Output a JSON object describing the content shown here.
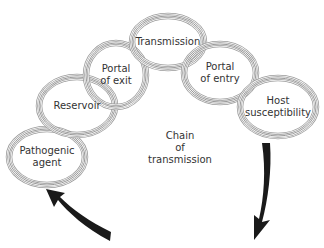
{
  "diagram": {
    "title": "Chain of transmission",
    "center_label": [
      "Chain",
      "of",
      "transmission"
    ],
    "links": [
      {
        "id": "pathogenic-agent",
        "lines": [
          "Pathogenic",
          "agent"
        ],
        "cx": 47,
        "cy": 157,
        "rx": 38,
        "ry": 28
      },
      {
        "id": "reservoir",
        "lines": [
          "Reservoir"
        ],
        "cx": 77,
        "cy": 106,
        "rx": 38,
        "ry": 29
      },
      {
        "id": "portal-of-exit",
        "lines": [
          "Portal",
          "of exit"
        ],
        "cx": 116,
        "cy": 75,
        "rx": 30,
        "ry": 32
      },
      {
        "id": "transmission",
        "lines": [
          "Transmission"
        ],
        "cx": 168,
        "cy": 42,
        "rx": 36,
        "ry": 26
      },
      {
        "id": "portal-of-entry",
        "lines": [
          "Portal",
          "of entry"
        ],
        "cx": 220,
        "cy": 73,
        "rx": 36,
        "ry": 29
      },
      {
        "id": "host-susceptibility",
        "lines": [
          "Host",
          "susceptibility"
        ],
        "cx": 278,
        "cy": 107,
        "rx": 38,
        "ry": 29
      }
    ],
    "ring_color": "#9a9a9a",
    "arrow_color": "#1a1a1a",
    "arrows": [
      {
        "id": "arrow-host-to-bottom",
        "direction": "down-left"
      },
      {
        "id": "arrow-bottom-to-pathogen",
        "direction": "up-left"
      }
    ]
  }
}
